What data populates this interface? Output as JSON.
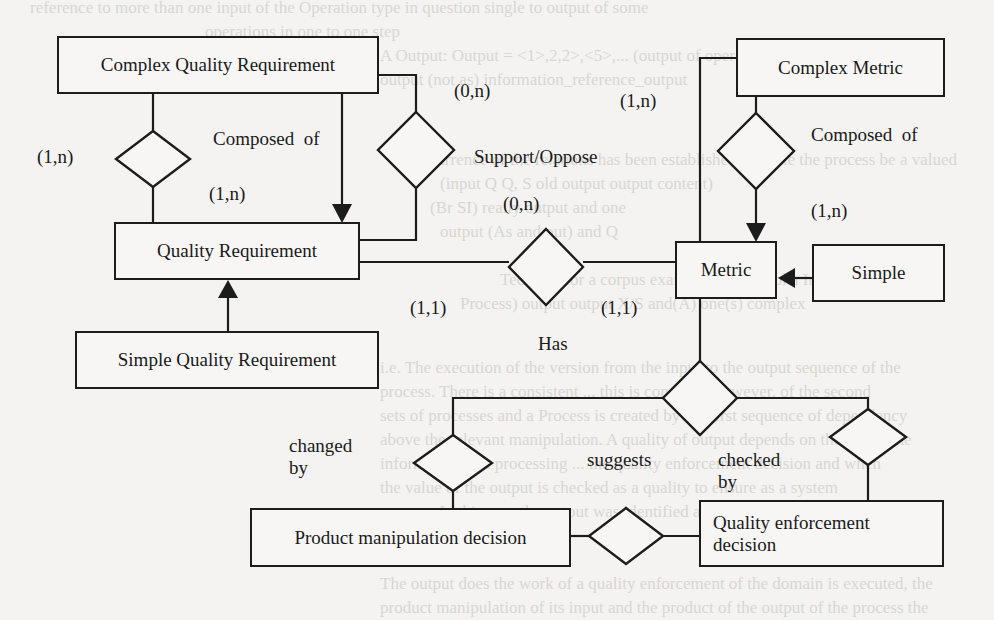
{
  "diagram": {
    "type": "entity-relationship",
    "colors": {
      "line": "#1c1c1c",
      "text": "#1a1a1a",
      "paper": "#f4f3f1",
      "bleed_through": "#d8d6d3"
    },
    "entities": [
      {
        "id": "complex_quality_requirement",
        "label": "Complex Quality Requirement",
        "x": 57,
        "y": 36,
        "w": 322,
        "h": 58
      },
      {
        "id": "quality_requirement",
        "label": "Quality Requirement",
        "x": 114,
        "y": 222,
        "w": 246,
        "h": 58
      },
      {
        "id": "simple_quality_requirement",
        "label": "Simple Quality Requirement",
        "x": 75,
        "y": 331,
        "w": 304,
        "h": 58
      },
      {
        "id": "complex_metric",
        "label": "Complex Metric",
        "x": 736,
        "y": 38,
        "w": 209,
        "h": 59
      },
      {
        "id": "metric",
        "label": "Metric",
        "x": 675,
        "y": 241,
        "w": 102,
        "h": 58
      },
      {
        "id": "simple",
        "label": "Simple",
        "x": 812,
        "y": 244,
        "w": 133,
        "h": 58
      },
      {
        "id": "product_manipulation_decision",
        "label": "Product manipulation decision",
        "x": 250,
        "y": 508,
        "w": 321,
        "h": 59
      },
      {
        "id": "quality_enforcement_decision",
        "label": "Quality enforcement\ndecision",
        "x": 699,
        "y": 500,
        "w": 245,
        "h": 67
      }
    ],
    "relationships": [
      {
        "id": "composed_of_quality",
        "cx": 153,
        "cy": 159,
        "hw": 37,
        "hh": 28
      },
      {
        "id": "support_oppose",
        "cx": 416,
        "cy": 150,
        "hw": 38,
        "hh": 38
      },
      {
        "id": "has",
        "cx": 546,
        "cy": 267,
        "hw": 37,
        "hh": 38
      },
      {
        "id": "composed_of_metric",
        "cx": 756,
        "cy": 151,
        "hw": 38,
        "hh": 38
      },
      {
        "id": "central_decision",
        "cx": 700,
        "cy": 398,
        "hw": 37,
        "hh": 37
      },
      {
        "id": "changed_by",
        "cx": 453,
        "cy": 463,
        "hw": 39,
        "hh": 28
      },
      {
        "id": "checked_by",
        "cx": 868,
        "cy": 437,
        "hw": 38,
        "hh": 28
      },
      {
        "id": "suggests",
        "cx": 626,
        "cy": 536,
        "hw": 37,
        "hh": 28
      }
    ],
    "labels": [
      {
        "id": "card_cqr_left",
        "text": "(1,n)",
        "x": 37,
        "y": 146
      },
      {
        "id": "composed_of_left",
        "text": "Composed  of",
        "x": 213,
        "y": 128
      },
      {
        "id": "card_qr_composed",
        "text": "(1,n)",
        "x": 209,
        "y": 183
      },
      {
        "id": "card_cqr_support",
        "text": "(0,n)",
        "x": 454,
        "y": 80
      },
      {
        "id": "support_oppose_label",
        "text": "Support/Oppose",
        "x": 474,
        "y": 146
      },
      {
        "id": "card_qr_support",
        "text": "(0,n)",
        "x": 503,
        "y": 193
      },
      {
        "id": "card_cm_left",
        "text": "(1,n)",
        "x": 620,
        "y": 90
      },
      {
        "id": "composed_of_right",
        "text": "Composed  of",
        "x": 811,
        "y": 124
      },
      {
        "id": "card_metric_composed",
        "text": "(1,n)",
        "x": 811,
        "y": 200
      },
      {
        "id": "card_qr_has",
        "text": "(1,1)",
        "x": 410,
        "y": 297
      },
      {
        "id": "card_metric_has",
        "text": "(1,1)",
        "x": 601,
        "y": 297
      },
      {
        "id": "has_label",
        "text": "Has",
        "x": 538,
        "y": 333
      },
      {
        "id": "changed_by_label",
        "text": "changed\nby",
        "x": 289,
        "y": 435
      },
      {
        "id": "suggests_label",
        "text": "suggests",
        "x": 587,
        "y": 449
      },
      {
        "id": "checked_by_label",
        "text": "checked\nby",
        "x": 718,
        "y": 449
      }
    ],
    "bleed_through_text": [
      {
        "text": "reference to more than one input of the Operation type in question    single to output of some",
        "x": 30,
        "y": -4
      },
      {
        "text": "operations in one to one step",
        "x": 205,
        "y": 20
      },
      {
        "text": "A Output: Output   =  <1>,2,2>,<5>,...  (output of operation); ...  is a finished process",
        "x": 380,
        "y": 44
      },
      {
        "text": "output (not as) information_reference_output",
        "x": 380,
        "y": 68
      },
      {
        "text": "A recurrence of the relations has been established to make the process be a valued",
        "x": 400,
        "y": 148
      },
      {
        "text": "(input Q Q, S old output output content)",
        "x": 440,
        "y": 172
      },
      {
        "text": "(Br SI) really output and  one",
        "x": 430,
        "y": 196
      },
      {
        "text": "output (As and out) and Q",
        "x": 440,
        "y": 220
      },
      {
        "text": "Tecsome for a corpus example the symbol a Ind ... output",
        "x": 500,
        "y": 268
      },
      {
        "text": "Process) output output X/S and(A) one(s) complex",
        "x": 460,
        "y": 292
      },
      {
        "text": "i.e. The execution of the  version from the input to the output sequence of the",
        "x": 380,
        "y": 356
      },
      {
        "text": "process. There is a consistent ... this is concrete. However, of the second",
        "x": 380,
        "y": 380
      },
      {
        "text": "sets of processes and a Process is created by the first sequence of dependency",
        "x": 380,
        "y": 404
      },
      {
        "text": "above the relevant manipulation. A quality of output depends on the use of the",
        "x": 380,
        "y": 428
      },
      {
        "text": "information of a processing ... the quality enforcement decision and when",
        "x": 380,
        "y": 452
      },
      {
        "text": "the value of the output is checked as a quality to ensure as a system",
        "x": 380,
        "y": 476
      },
      {
        "text": "process. In this case the output was identified as part of the process only",
        "x": 380,
        "y": 500
      },
      {
        "text": "The output does the work of a quality enforcement of the domain is executed, the",
        "x": 380,
        "y": 572
      },
      {
        "text": "product manipulation of its input and the product of the output of the process the",
        "x": 380,
        "y": 596
      }
    ]
  }
}
